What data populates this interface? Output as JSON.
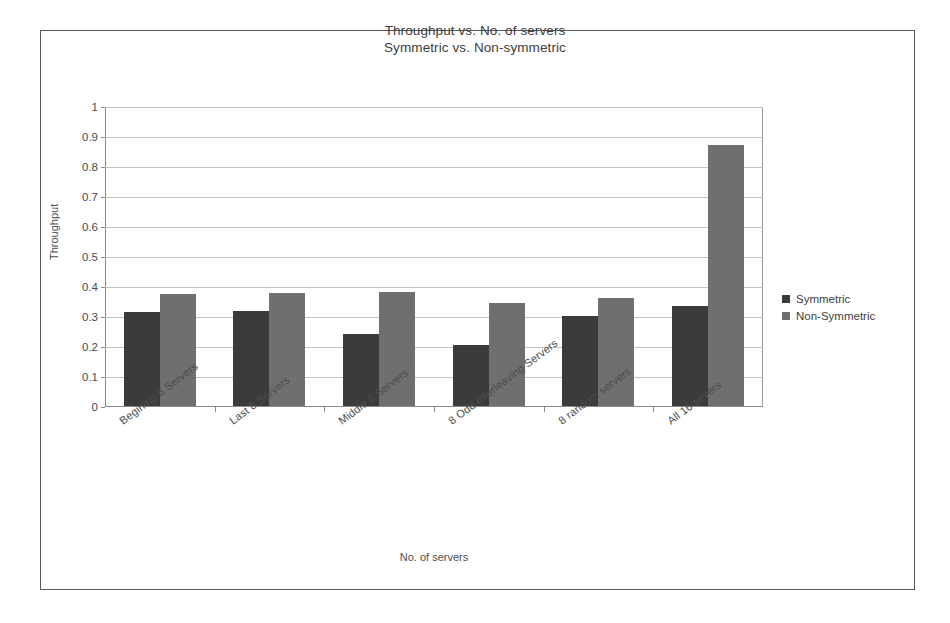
{
  "chart_data": {
    "type": "bar",
    "title": "Throughput vs. No. of servers",
    "subtitle": "Symmetric vs. Non-symmetric",
    "xlabel": "No. of servers",
    "ylabel": "Throughput",
    "ylim": [
      0,
      1
    ],
    "ytick_labels": [
      "1",
      "0.9",
      "0.8",
      "0.7",
      "0.6",
      "0.5",
      "0.4",
      "0.3",
      "0.2",
      "0.1",
      "0"
    ],
    "ytick_values": [
      1,
      0.9,
      0.8,
      0.7,
      0.6,
      0.5,
      0.4,
      0.3,
      0.2,
      0.1,
      0
    ],
    "grid": true,
    "legend_position": "right",
    "categories": [
      "Begining 8 Servers",
      "Last 8 Servers",
      "Middle 8 Servers",
      "8 Odd Interleaving Servers",
      "8 random servers",
      "All 16 severs"
    ],
    "series": [
      {
        "name": "Symmetric",
        "color": "#3b3b3b",
        "values": [
          0.315,
          0.318,
          0.24,
          0.205,
          0.3,
          0.335
        ]
      },
      {
        "name": "Non-Symmetric",
        "color": "#6f6f6f",
        "values": [
          0.375,
          0.378,
          0.38,
          0.345,
          0.36,
          0.87
        ]
      }
    ]
  },
  "frame": {
    "border_color": "#5a5a5a"
  }
}
